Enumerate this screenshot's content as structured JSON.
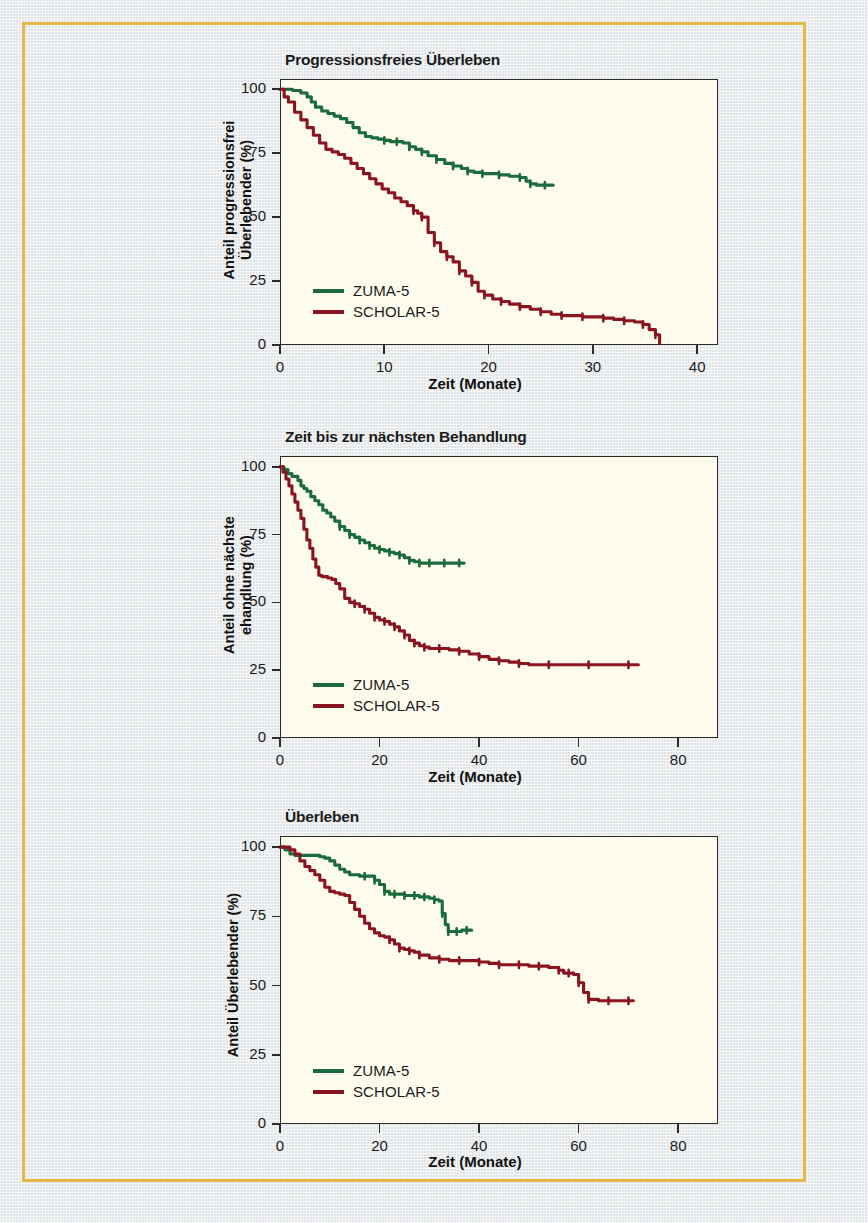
{
  "figure": {
    "border_color": "#e8b84b",
    "page_background": "#e9edf0",
    "plot_background": "#fdfcec",
    "axis_color": "#2b2b2b"
  },
  "series_colors": {
    "zuma": "#1c6b3c",
    "scholar": "#8a1420"
  },
  "legend": {
    "zuma_label": "ZUMA-5",
    "scholar_label": "SCHOLAR-5"
  },
  "chart_data": [
    {
      "type": "line",
      "title": "Progressionsfreies Überleben",
      "xlabel": "Zeit (Monate)",
      "ylabel": "Anteil progressionsfrei Überlebender (%)",
      "ylabel_line1": "Anteil progressionsfrei",
      "ylabel_line2": "Überlebender (%)",
      "xlim": [
        0,
        42
      ],
      "ylim": [
        0,
        104
      ],
      "xticks": [
        0,
        10,
        20,
        30,
        40
      ],
      "yticks": [
        0,
        25,
        50,
        75,
        100
      ],
      "grid": false,
      "legend_position": "bottom-left",
      "series": [
        {
          "name": "ZUMA-5",
          "color": "#1c6b3c",
          "x": [
            0,
            0.6,
            1.2,
            2.0,
            2.6,
            3.0,
            3.4,
            4.0,
            4.6,
            5.2,
            5.8,
            6.4,
            7.0,
            7.6,
            8.2,
            8.8,
            9.4,
            10.0,
            10.6,
            11.2,
            11.8,
            12.4,
            13.0,
            13.6,
            14.2,
            15.0,
            15.8,
            16.6,
            17.4,
            18.0,
            18.6,
            19.4,
            20.2,
            21.0,
            22.0,
            23.0,
            23.6,
            24.0,
            24.6,
            25.4,
            26.2
          ],
          "y": [
            100,
            100,
            99.5,
            98.5,
            97.0,
            95.0,
            93.0,
            91.5,
            90.5,
            89.5,
            88.5,
            87.0,
            85.0,
            83.0,
            81.5,
            81.0,
            80.5,
            80.0,
            79.5,
            79.5,
            79.0,
            77.5,
            76.5,
            75.5,
            74.0,
            72.5,
            71.0,
            70.0,
            69.0,
            68.0,
            67.5,
            67.0,
            67.0,
            66.5,
            66.0,
            65.5,
            64.0,
            63.0,
            62.5,
            62.5,
            62.5
          ]
        },
        {
          "name": "SCHOLAR-5",
          "color": "#8a1420",
          "x": [
            0,
            0.4,
            0.8,
            1.4,
            2.0,
            2.6,
            3.2,
            3.8,
            4.4,
            5.0,
            5.6,
            6.2,
            6.8,
            7.4,
            8.0,
            8.6,
            9.2,
            9.8,
            10.4,
            11.0,
            11.6,
            12.2,
            12.8,
            13.2,
            13.6,
            14.2,
            14.8,
            15.4,
            16.0,
            16.6,
            17.2,
            17.8,
            18.4,
            19.0,
            19.6,
            20.4,
            21.2,
            22.0,
            23.0,
            24.0,
            25.0,
            26.0,
            27.0,
            28.0,
            29.0,
            30.0,
            31.0,
            32.0,
            33.0,
            34.0,
            34.8,
            35.4,
            36.0,
            36.4
          ],
          "y": [
            100,
            97.0,
            95.0,
            91.0,
            88.0,
            85.0,
            82.0,
            79.0,
            76.5,
            75.5,
            74.5,
            73.0,
            71.0,
            69.0,
            67.0,
            65.0,
            63.0,
            61.0,
            59.5,
            57.5,
            56.0,
            54.5,
            52.5,
            51.5,
            50.0,
            44.0,
            40.0,
            36.5,
            34.5,
            32.5,
            29.0,
            27.0,
            24.5,
            21.0,
            19.5,
            18.0,
            17.0,
            16.0,
            15.0,
            14.0,
            13.0,
            12.0,
            11.5,
            11.5,
            11.0,
            11.0,
            10.5,
            10.0,
            9.5,
            9.0,
            8.0,
            6.0,
            4.0,
            0.5
          ]
        }
      ]
    },
    {
      "type": "line",
      "title": "Zeit bis zur nächsten Behandlung",
      "xlabel": "Zeit (Monate)",
      "ylabel": "Anteil ohne nächste ehandlung (%)",
      "ylabel_line1": "Anteil ohne nächste",
      "ylabel_line2": "ehandlung (%)",
      "xlim": [
        0,
        88
      ],
      "ylim": [
        0,
        104
      ],
      "xticks": [
        0,
        20,
        40,
        60,
        80
      ],
      "yticks": [
        0,
        25,
        50,
        75,
        100
      ],
      "grid": false,
      "legend_position": "bottom-left",
      "series": [
        {
          "name": "ZUMA-5",
          "color": "#1c6b3c",
          "x": [
            0,
            0.8,
            1.6,
            2.4,
            3.0,
            3.6,
            4.2,
            4.8,
            5.4,
            6.2,
            7.0,
            7.8,
            8.6,
            9.4,
            10.2,
            11.0,
            12.0,
            13.0,
            14.0,
            15.0,
            16.0,
            17.0,
            18.0,
            19.0,
            20.0,
            21.0,
            22.0,
            23.0,
            24.0,
            25.0,
            26.0,
            27.0,
            28.0,
            29.0,
            30.0,
            31.5,
            33.0,
            34.5,
            36.0,
            37.0
          ],
          "y": [
            100,
            99.0,
            97.5,
            96.5,
            96.5,
            95.0,
            93.0,
            92.0,
            91.0,
            89.0,
            87.5,
            86.0,
            84.0,
            83.0,
            81.5,
            80.0,
            78.0,
            76.5,
            75.0,
            74.0,
            73.0,
            72.0,
            71.0,
            70.0,
            69.5,
            69.0,
            68.5,
            68.0,
            67.5,
            66.5,
            65.5,
            65.0,
            64.5,
            64.5,
            64.5,
            64.5,
            64.5,
            64.5,
            64.5,
            64.5
          ]
        },
        {
          "name": "SCHOLAR-5",
          "color": "#8a1420",
          "x": [
            0,
            0.6,
            1.2,
            1.8,
            2.4,
            3.0,
            3.6,
            4.2,
            4.8,
            5.4,
            6.0,
            6.6,
            7.2,
            7.8,
            8.4,
            9.0,
            9.6,
            10.4,
            11.2,
            12.0,
            13.0,
            14.0,
            15.0,
            16.0,
            17.0,
            18.0,
            19.0,
            20.0,
            21.0,
            22.0,
            23.0,
            24.0,
            25.0,
            26.0,
            27.0,
            28.0,
            29.0,
            30.0,
            32.0,
            34.0,
            36.0,
            38.0,
            40.0,
            42.0,
            44.0,
            46.0,
            48.0,
            50.0,
            54.0,
            58.0,
            62.0,
            66.0,
            70.0,
            72.0
          ],
          "y": [
            100,
            98.0,
            95.5,
            93.0,
            90.0,
            87.0,
            84.0,
            81.0,
            77.0,
            73.0,
            70.0,
            66.0,
            63.0,
            60.0,
            59.5,
            59.5,
            59.0,
            58.5,
            57.0,
            55.0,
            51.5,
            50.0,
            49.5,
            48.5,
            47.5,
            46.0,
            44.5,
            43.5,
            43.0,
            42.0,
            41.0,
            39.5,
            38.0,
            36.0,
            35.0,
            34.0,
            33.5,
            33.0,
            33.0,
            32.5,
            32.0,
            31.0,
            30.0,
            29.0,
            28.5,
            28.0,
            27.5,
            27.0,
            27.0,
            27.0,
            27.0,
            27.0,
            27.0,
            27.0
          ]
        }
      ]
    },
    {
      "type": "line",
      "title": "Überleben",
      "xlabel": "Zeit (Monate)",
      "ylabel": "Anteil Überlebender (%)",
      "ylabel_line1": "Anteil Überlebender (%)",
      "ylabel_line2": "",
      "xlim": [
        0,
        88
      ],
      "ylim": [
        0,
        104
      ],
      "xticks": [
        0,
        20,
        40,
        60,
        80
      ],
      "yticks": [
        0,
        25,
        50,
        75,
        100
      ],
      "grid": false,
      "legend_position": "bottom-left",
      "series": [
        {
          "name": "ZUMA-5",
          "color": "#1c6b3c",
          "x": [
            0,
            1.0,
            2.0,
            3.0,
            4.0,
            5.0,
            6.0,
            7.0,
            8.0,
            9.0,
            10.0,
            11.0,
            12.0,
            13.0,
            14.0,
            15.0,
            16.0,
            17.0,
            18.0,
            19.0,
            20.0,
            21.0,
            22.0,
            23.0,
            24.0,
            25.0,
            26.0,
            27.0,
            28.0,
            29.0,
            30.0,
            31.0,
            32.0,
            32.6,
            33.2,
            33.8,
            34.4,
            35.5,
            36.5,
            37.5,
            38.5
          ],
          "y": [
            100,
            99.0,
            97.5,
            97.0,
            97.0,
            97.0,
            97.0,
            97.0,
            96.5,
            96.0,
            95.0,
            93.5,
            92.0,
            91.0,
            90.0,
            90.0,
            89.5,
            89.5,
            89.5,
            88.0,
            86.5,
            84.0,
            83.0,
            83.0,
            83.0,
            82.5,
            82.5,
            82.5,
            82.0,
            82.0,
            81.5,
            81.0,
            80.5,
            76.0,
            72.0,
            69.5,
            69.5,
            69.5,
            70.0,
            70.0,
            70.0
          ]
        },
        {
          "name": "SCHOLAR-5",
          "color": "#8a1420",
          "x": [
            0,
            1.0,
            2.0,
            3.0,
            4.0,
            5.0,
            6.0,
            7.0,
            8.0,
            9.0,
            10.0,
            11.0,
            12.0,
            13.0,
            14.0,
            15.0,
            16.0,
            17.0,
            18.0,
            19.0,
            20.0,
            21.0,
            22.0,
            23.0,
            24.0,
            25.0,
            26.0,
            27.0,
            28.0,
            30.0,
            32.0,
            34.0,
            36.0,
            38.0,
            40.0,
            42.0,
            44.0,
            46.0,
            48.0,
            50.0,
            52.0,
            54.0,
            56.0,
            57.0,
            58.0,
            59.0,
            60.0,
            61.0,
            62.0,
            64.0,
            66.0,
            68.0,
            70.0,
            71.0
          ],
          "y": [
            100,
            100,
            99.0,
            97.5,
            95.0,
            93.0,
            91.5,
            90.0,
            88.0,
            85.5,
            84.0,
            83.5,
            83.0,
            82.5,
            80.0,
            77.5,
            75.0,
            72.5,
            70.5,
            69.0,
            68.0,
            67.5,
            66.5,
            65.0,
            63.5,
            63.0,
            62.5,
            62.0,
            61.0,
            60.0,
            59.5,
            59.0,
            59.0,
            59.0,
            58.5,
            58.0,
            57.5,
            57.5,
            57.5,
            57.0,
            57.0,
            56.5,
            55.5,
            54.5,
            54.5,
            54.0,
            51.0,
            47.5,
            45.0,
            44.5,
            44.5,
            44.5,
            44.5,
            44.5
          ]
        }
      ]
    }
  ]
}
